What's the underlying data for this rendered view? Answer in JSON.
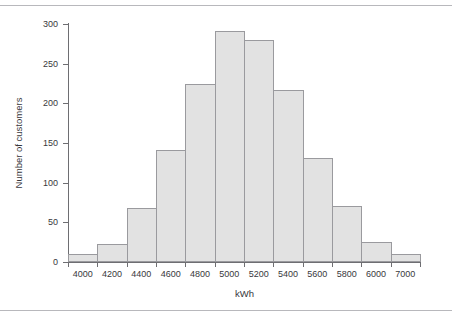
{
  "chart_data": {
    "type": "bar",
    "title": "",
    "subtitle": "",
    "xlabel": "kWh",
    "ylabel": "Number of customers",
    "categories": [
      "4000",
      "4200",
      "4400",
      "4600",
      "4800",
      "5000",
      "5200",
      "5400",
      "5600",
      "5800",
      "6000",
      "7000"
    ],
    "values": [
      10,
      23,
      68,
      141,
      224,
      291,
      280,
      217,
      131,
      71,
      25,
      10
    ],
    "bin_edges": [
      "3900",
      "4100",
      "4300",
      "4500",
      "4700",
      "4900",
      "5100",
      "5300",
      "5500",
      "5700",
      "5900",
      "6900",
      "7100"
    ],
    "ylim": [
      0,
      300
    ],
    "yticks": [
      "0",
      "50",
      "100",
      "150",
      "200",
      "250",
      "300"
    ],
    "xticklabels": [
      "4000",
      "4200",
      "4400",
      "4600",
      "4800",
      "5000",
      "5200",
      "5400",
      "5600",
      "5800",
      "6000",
      "7000"
    ],
    "grid": false,
    "legend": null,
    "bar_fill": "#e2e2e2",
    "bar_border": "#9a9a9e",
    "axis_color": "#6e6e72",
    "text_color": "#38383c",
    "background": "#ffffff",
    "rule_color": "#b8b8bc"
  }
}
